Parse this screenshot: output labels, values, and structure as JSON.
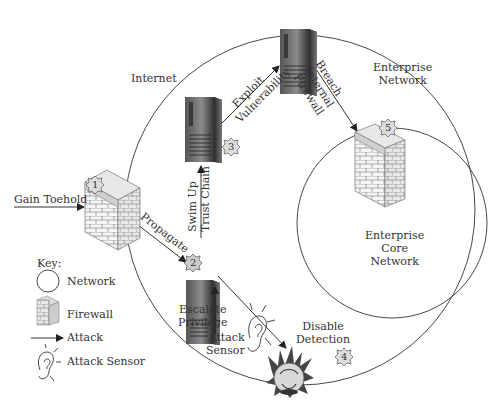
{
  "diagram": {
    "regions": {
      "internet": "Internet",
      "enterprise_network": [
        "Enterprise",
        "Network"
      ],
      "enterprise_core_network": [
        "Enterprise",
        "Core",
        "Network"
      ]
    },
    "steps": [
      {
        "number": "1",
        "label": "Gain Toehold",
        "node": "firewall"
      },
      {
        "number": "2",
        "label": "Propagate",
        "node": "server"
      },
      {
        "number": "3",
        "label": "Swim Up Trust Chain",
        "node": "server"
      },
      {
        "number": "4",
        "label": "Disable Detection",
        "node": "attack-sensor"
      },
      {
        "number": "5",
        "label": "Breach Internal Firewall",
        "node": "firewall"
      }
    ],
    "edge_labels": {
      "gain_toehold": "Gain Toehold",
      "propagate": "Propagate",
      "swim_up": [
        "Swim Up",
        "Trust Chain"
      ],
      "exploit": [
        "Exploit",
        "Vulnerability"
      ],
      "breach": [
        "Breach",
        "Internal",
        "Firewall"
      ],
      "escalate": [
        "Escalate",
        "Privilege"
      ],
      "attack_sensor": [
        "Attack",
        "Sensor"
      ],
      "disable_detection": [
        "Disable",
        "Detection"
      ]
    },
    "badges": {
      "b1": "1",
      "b2": "2",
      "b3": "3",
      "b4": "4",
      "b5": "5"
    },
    "key": {
      "title": "Key:",
      "items": [
        {
          "icon": "network-circle-icon",
          "label": "Network"
        },
        {
          "icon": "firewall-icon",
          "label": "Firewall"
        },
        {
          "icon": "arrow-icon",
          "label": "Attack"
        },
        {
          "icon": "ear-icon",
          "label": "Attack Sensor"
        }
      ]
    },
    "colors": {
      "line": "#333333",
      "brick": "#f2f2f2",
      "server_dark": "#3a3a3a",
      "server_light": "#9a9a9a"
    }
  }
}
